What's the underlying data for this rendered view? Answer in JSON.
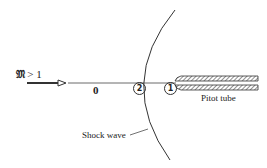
{
  "figure": {
    "mach_label": {
      "symbol": "𝔐",
      "relation": " > 1"
    },
    "region_labels": {
      "free_stream": "0",
      "behind_shock": "2",
      "pitot_inlet": "1"
    },
    "pitot_tube_label": "Pitot tube",
    "shock_wave_label": "Shock wave",
    "colors": {
      "line": "#333333",
      "background": "#ffffff"
    }
  }
}
